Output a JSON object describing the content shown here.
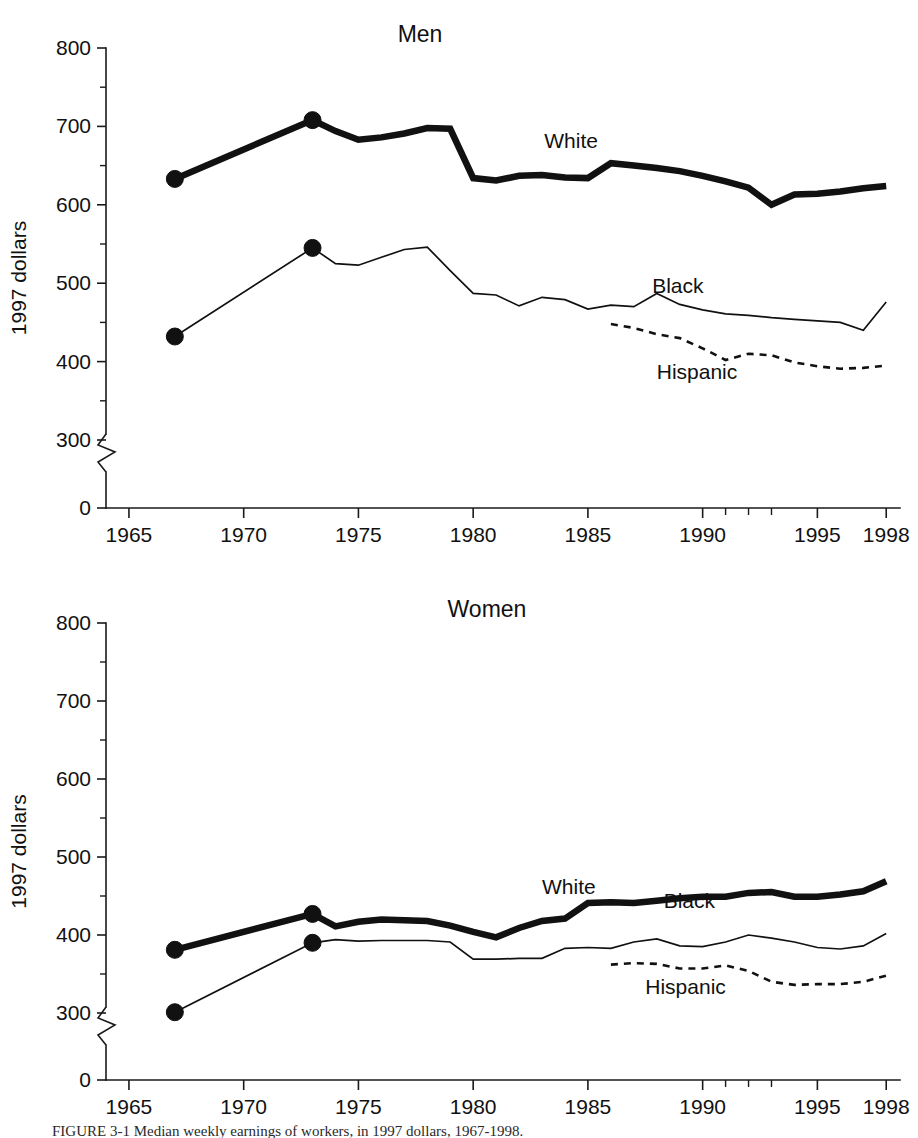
{
  "figure": {
    "caption": "FIGURE 3-1  Median weekly earnings of workers, in 1997 dollars, 1967-1998."
  },
  "chart_data": [
    {
      "id": "men",
      "type": "line",
      "title": "Men",
      "xlabel": "",
      "ylabel": "1997 dollars",
      "xlim": [
        1964,
        1998.6
      ],
      "ylim": [
        0,
        800
      ],
      "y_ticks": [
        0,
        300,
        400,
        500,
        600,
        700,
        800
      ],
      "y_tick_labels": [
        "0",
        "300",
        "400",
        "500",
        "600",
        "700",
        "800"
      ],
      "x_ticks": [
        1965,
        1970,
        1975,
        1980,
        1985,
        1990,
        1995,
        1998
      ],
      "x_tick_labels": [
        "1965",
        "1970",
        "1975",
        "1980",
        "1985",
        "1990",
        "1995",
        "1998"
      ],
      "axis_break": true,
      "grid": false,
      "legend_position": "inline-labels",
      "series": [
        {
          "name": "White",
          "style": "thick-solid",
          "label_x": 1983.1,
          "label_y": 672,
          "markers_at": [
            1967,
            1973
          ],
          "x": [
            1967,
            1973,
            1974,
            1975,
            1976,
            1977,
            1978,
            1979,
            1980,
            1981,
            1982,
            1983,
            1984,
            1985,
            1986,
            1987,
            1988,
            1989,
            1990,
            1991,
            1992,
            1993,
            1994,
            1995,
            1996,
            1997,
            1998
          ],
          "values": [
            633,
            708,
            694,
            683,
            686,
            691,
            698,
            697,
            634,
            631,
            637,
            638,
            635,
            634,
            653,
            650,
            647,
            643,
            637,
            630,
            622,
            600,
            613,
            614,
            617,
            621,
            624
          ]
        },
        {
          "name": "Black",
          "style": "thin-solid",
          "label_x": 1987.8,
          "label_y": 487,
          "markers_at": [
            1967,
            1973
          ],
          "x": [
            1967,
            1973,
            1974,
            1975,
            1976,
            1977,
            1978,
            1979,
            1980,
            1981,
            1982,
            1983,
            1984,
            1985,
            1986,
            1987,
            1988,
            1989,
            1990,
            1991,
            1992,
            1993,
            1994,
            1995,
            1996,
            1997,
            1998
          ],
          "values": [
            432,
            545,
            525,
            523,
            533,
            543,
            546,
            516,
            487,
            485,
            471,
            482,
            479,
            467,
            472,
            470,
            487,
            473,
            466,
            461,
            459,
            456,
            454,
            452,
            450,
            440,
            476
          ]
        },
        {
          "name": "Hispanic",
          "style": "dashed",
          "label_x": 1988.0,
          "label_y": 378,
          "markers_at": [],
          "x": [
            1986,
            1987,
            1988,
            1989,
            1990,
            1991,
            1992,
            1993,
            1994,
            1995,
            1996,
            1997,
            1998
          ],
          "values": [
            448,
            443,
            435,
            430,
            417,
            402,
            410,
            408,
            399,
            394,
            391,
            392,
            395
          ]
        }
      ]
    },
    {
      "id": "women",
      "type": "line",
      "title": "Women",
      "xlabel": "",
      "ylabel": "1997 dollars",
      "xlim": [
        1964,
        1998.6
      ],
      "ylim": [
        0,
        800
      ],
      "y_ticks": [
        0,
        300,
        400,
        500,
        600,
        700,
        800
      ],
      "y_tick_labels": [
        "0",
        "300",
        "400",
        "500",
        "600",
        "700",
        "800"
      ],
      "x_ticks": [
        1965,
        1970,
        1975,
        1980,
        1985,
        1990,
        1995,
        1998
      ],
      "x_tick_labels": [
        "1965",
        "1970",
        "1975",
        "1980",
        "1985",
        "1990",
        "1995",
        "1998"
      ],
      "axis_break": true,
      "grid": false,
      "legend_position": "inline-labels",
      "series": [
        {
          "name": "White",
          "style": "thick-solid",
          "label_x": 1983.0,
          "label_y": 452,
          "markers_at": [
            1967,
            1973
          ],
          "x": [
            1967,
            1973,
            1974,
            1975,
            1976,
            1977,
            1978,
            1979,
            1980,
            1981,
            1982,
            1983,
            1984,
            1985,
            1986,
            1987,
            1988,
            1989,
            1990,
            1991,
            1992,
            1993,
            1994,
            1995,
            1996,
            1997,
            1998
          ],
          "values": [
            381,
            427,
            411,
            417,
            420,
            419,
            418,
            412,
            404,
            397,
            409,
            418,
            421,
            441,
            442,
            441,
            444,
            447,
            449,
            449,
            454,
            455,
            449,
            449,
            452,
            456,
            469
          ]
        },
        {
          "name": "Black",
          "style": "thin-solid",
          "label_x": 1988.3,
          "label_y": 434,
          "markers_at": [
            1967,
            1973
          ],
          "x": [
            1967,
            1973,
            1974,
            1975,
            1976,
            1977,
            1978,
            1979,
            1980,
            1981,
            1982,
            1983,
            1984,
            1985,
            1986,
            1987,
            1988,
            1989,
            1990,
            1991,
            1992,
            1993,
            1994,
            1995,
            1996,
            1997,
            1998
          ],
          "values": [
            301,
            390,
            394,
            392,
            393,
            393,
            393,
            391,
            369,
            369,
            370,
            370,
            383,
            384,
            383,
            391,
            395,
            386,
            385,
            391,
            400,
            396,
            391,
            384,
            382,
            386,
            402
          ]
        },
        {
          "name": "Hispanic",
          "style": "dashed",
          "label_x": 1987.5,
          "label_y": 324,
          "markers_at": [],
          "x": [
            1986,
            1987,
            1988,
            1989,
            1990,
            1991,
            1992,
            1993,
            1994,
            1995,
            1996,
            1997,
            1998
          ],
          "values": [
            362,
            364,
            363,
            357,
            357,
            361,
            354,
            340,
            336,
            337,
            337,
            340,
            348
          ]
        }
      ]
    }
  ]
}
